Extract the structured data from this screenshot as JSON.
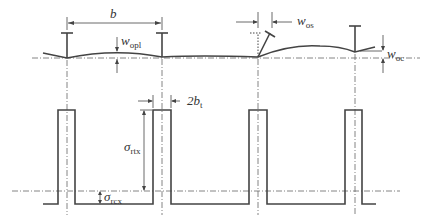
{
  "diagram": {
    "labels": {
      "b": "b",
      "w_opl": "w",
      "w_opl_sub": "opl",
      "w_os": "w",
      "w_os_sub": "os",
      "w_oc": "w",
      "w_oc_sub": "oc",
      "two_bt": "2b",
      "two_bt_sub": "t",
      "sigma_rtx": "σ",
      "sigma_rtx_sub": "rtx",
      "sigma_rcx": "σ",
      "sigma_rcx_sub": "rcx"
    },
    "stiffener_positions_px": [
      67,
      162,
      258,
      355
    ],
    "colors": {
      "line": "#444444",
      "axis": "#666666",
      "background": "#ffffff"
    }
  }
}
